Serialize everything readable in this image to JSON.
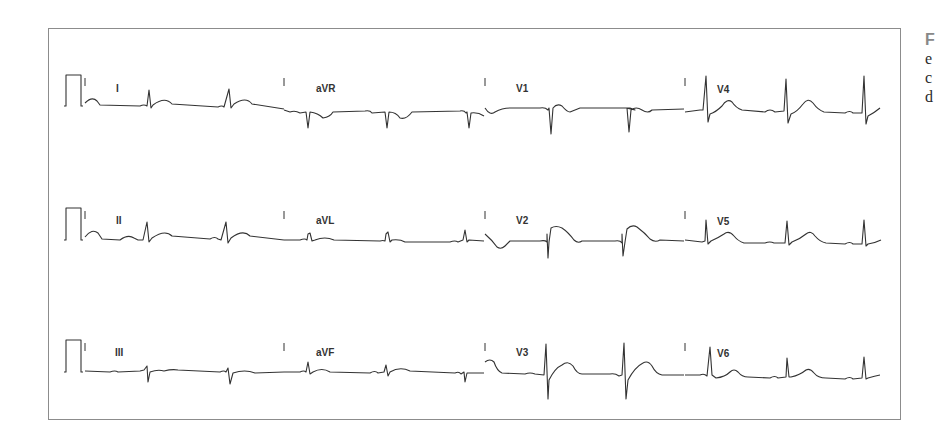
{
  "figure": {
    "type": "12-lead ECG",
    "layout": "3 rows x 4 columns",
    "rows": [
      {
        "leads": [
          "I",
          "aVR",
          "V1",
          "V4"
        ]
      },
      {
        "leads": [
          "II",
          "aVL",
          "V2",
          "V5"
        ]
      },
      {
        "leads": [
          "III",
          "aVF",
          "V3",
          "V6"
        ]
      }
    ],
    "labels": {
      "r0c0": "I",
      "r0c1": "aVR",
      "r0c2": "V1",
      "r0c3": "V4",
      "r1c0": "II",
      "r1c1": "aVL",
      "r1c2": "V2",
      "r1c3": "V5",
      "r2c0": "III",
      "r2c1": "aVF",
      "r2c2": "V3",
      "r2c3": "V6"
    },
    "calibration_pulse": true,
    "colors": {
      "trace": "#333333",
      "frame": "#8c8c8c",
      "caption_first": "#888888"
    }
  },
  "caption_partial": {
    "line1": "F",
    "line2": "e",
    "line3": "c",
    "line4": "d"
  }
}
